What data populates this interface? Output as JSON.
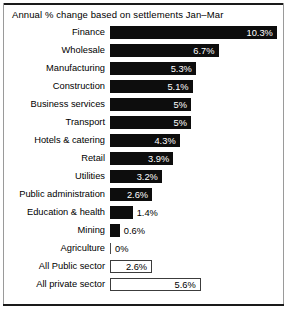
{
  "chart_data": {
    "type": "bar",
    "title": "Annual % change based on settlements Jan–Mar",
    "xlabel": "",
    "ylabel": "",
    "orientation": "horizontal",
    "grid": false,
    "legend": "none",
    "xlim": [
      0,
      10.3
    ],
    "value_suffix": "%",
    "categories": [
      "Finance",
      "Wholesale",
      "Manufacturing",
      "Construction",
      "Business services",
      "Transport",
      "Hotels & catering",
      "Retail",
      "Utilities",
      "Public administration",
      "Education & health",
      "Mining",
      "Agriculture",
      "All Public sector",
      "All private sector"
    ],
    "values": [
      10.3,
      6.7,
      5.3,
      5.1,
      5,
      5,
      4.3,
      3.9,
      3.2,
      2.6,
      1.4,
      0.6,
      0,
      2.6,
      5.6
    ],
    "value_labels": [
      "10.3%",
      "6.7%",
      "5.3%",
      "5.1%",
      "5%",
      "5%",
      "4.3%",
      "3.9%",
      "3.2%",
      "2.6%",
      "1.4%",
      "0.6%",
      "0%",
      "2.6%",
      "5.6%"
    ],
    "bar_styles": [
      "filled",
      "filled",
      "filled",
      "filled",
      "filled",
      "filled",
      "filled",
      "filled",
      "filled",
      "filled",
      "filled",
      "filled",
      "zero-tick",
      "outlined",
      "outlined"
    ],
    "label_placement": [
      "inside",
      "inside",
      "inside",
      "inside",
      "inside",
      "inside",
      "inside",
      "inside",
      "inside",
      "inside",
      "outside",
      "outside",
      "outside",
      "inside-dark",
      "inside-dark"
    ],
    "colors": {
      "bar_fill": "#0d0d0d",
      "bar_outline": "#3c3c3c",
      "background": "#ffffff",
      "text": "#000000",
      "inside_label": "#ffffff",
      "frame_rule": "#1a1a1a"
    }
  }
}
